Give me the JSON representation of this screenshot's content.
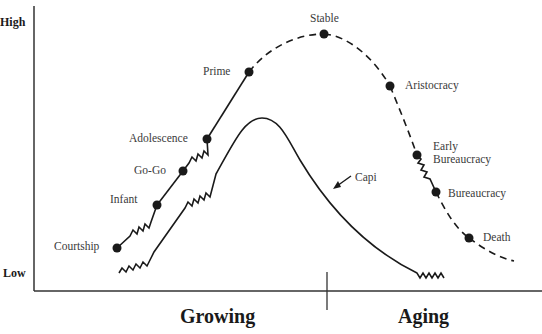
{
  "diagram": {
    "type": "lifecycle",
    "y_axis": {
      "high_label": "High",
      "low_label": "Low"
    },
    "phases": {
      "left": "Growing",
      "right": "Aging"
    },
    "stages": [
      {
        "name": "Courtship"
      },
      {
        "name": "Infant"
      },
      {
        "name": "Go-Go"
      },
      {
        "name": "Adolescence"
      },
      {
        "name": "Prime"
      },
      {
        "name": "Stable"
      },
      {
        "name": "Aristocracy"
      },
      {
        "name": "Early Bureaucracy",
        "line1": "Early",
        "line2": "Bureaucracy"
      },
      {
        "name": "Bureaucracy"
      },
      {
        "name": "Death"
      }
    ],
    "inner_curve_label": "Capi"
  }
}
